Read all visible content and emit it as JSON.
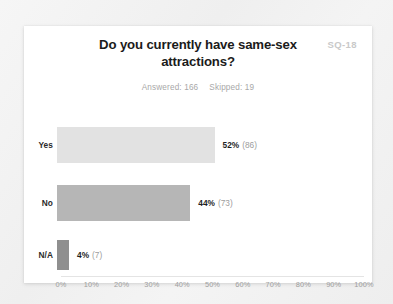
{
  "card": {
    "question_code": "SQ-18",
    "title": "Do you currently have same-sex attractions?",
    "answered_label": "Answered: 166",
    "skipped_label": "Skipped: 19"
  },
  "colors": {
    "card_background": "#ffffff",
    "page_background": "#f2f2f2",
    "bar_yes": "#e2e2e2",
    "bar_no": "#b6b6b6",
    "bar_na": "#8f8f8f",
    "title_text": "#1b1b1b",
    "muted_text": "#a8a8a8",
    "code_badge": "#c9c9c9"
  },
  "chart_data": {
    "type": "bar",
    "orientation": "horizontal",
    "title": "Do you currently have same-sex attractions?",
    "subtitle": "Answered: 166   Skipped: 19",
    "xlabel": "",
    "ylabel": "",
    "xlim": [
      0,
      100
    ],
    "grid": false,
    "legend": "none",
    "categories": [
      "Yes",
      "No",
      "N/A"
    ],
    "values": [
      52,
      44,
      4
    ],
    "counts": [
      86,
      73,
      7
    ],
    "value_labels": [
      "52%",
      "44%",
      "4%"
    ],
    "count_labels": [
      "(86)",
      "(73)",
      "(7)"
    ],
    "bar_colors": [
      "#e2e2e2",
      "#b6b6b6",
      "#8f8f8f"
    ],
    "x_ticks": [
      0,
      10,
      20,
      30,
      40,
      50,
      60,
      70,
      80,
      90,
      100
    ],
    "x_tick_labels": [
      "0%",
      "10%",
      "20%",
      "30%",
      "40%",
      "50%",
      "60%",
      "70%",
      "80%",
      "90%",
      "100%"
    ]
  }
}
